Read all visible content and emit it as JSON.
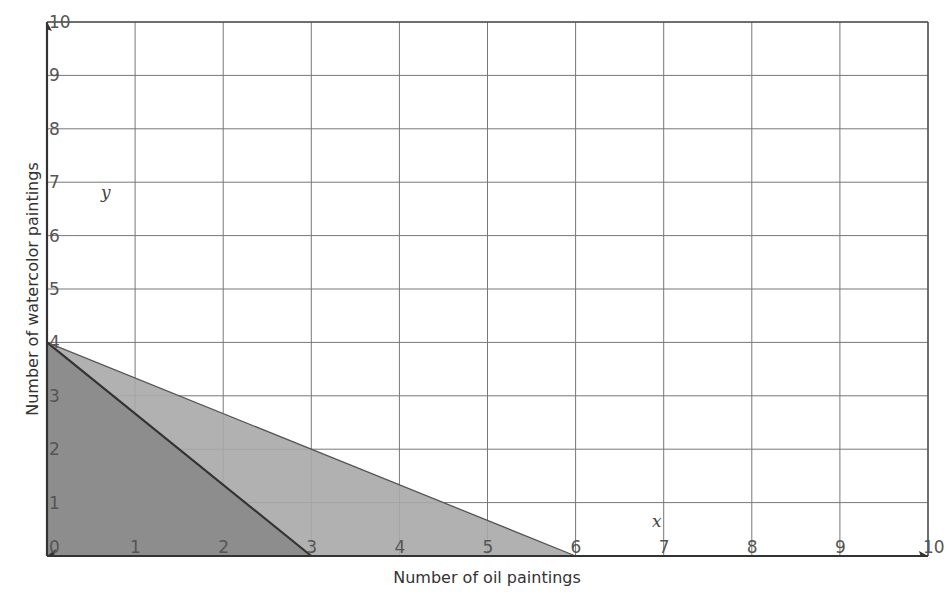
{
  "chart_data": {
    "type": "area",
    "title": "",
    "xlabel": "Number of oil paintings",
    "ylabel": "Number of watercolor paintings",
    "x_var": "x",
    "y_var": "y",
    "xlim": [
      0,
      10
    ],
    "ylim": [
      0,
      10
    ],
    "grid": true,
    "x_ticks": [
      "0",
      "1",
      "2",
      "3",
      "4",
      "5",
      "6",
      "7",
      "8",
      "9",
      "10"
    ],
    "y_ticks": [
      "0",
      "1",
      "2",
      "3",
      "4",
      "5",
      "6",
      "7",
      "8",
      "9",
      "10"
    ],
    "series": [
      {
        "name": "Region 1 (light)",
        "vertices": [
          [
            0,
            0
          ],
          [
            0,
            4
          ],
          [
            6,
            0
          ]
        ],
        "boundary": "4x + 6y = 24",
        "fill": "#a8a8a8"
      },
      {
        "name": "Region 2 (dark)",
        "vertices": [
          [
            0,
            0
          ],
          [
            0,
            4
          ],
          [
            3,
            0
          ]
        ],
        "boundary": "4x + 3y = 12",
        "fill": "#8a8a8a"
      }
    ],
    "lines": [
      {
        "from": [
          0,
          4
        ],
        "to": [
          6,
          0
        ]
      },
      {
        "from": [
          0,
          4
        ],
        "to": [
          3,
          0
        ]
      }
    ]
  }
}
